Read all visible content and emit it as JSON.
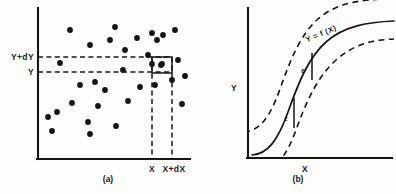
{
  "figure": {
    "panels": [
      {
        "id": "a",
        "caption": "(a)",
        "caption_x": 108,
        "caption_y": 182,
        "axes": {
          "y_axis": {
            "x": 38,
            "y_top": 8,
            "y_bottom": 159
          },
          "x_axis": {
            "y": 159,
            "x_left": 37,
            "x_right": 190
          }
        },
        "y_gridlines": [
          {
            "label": "Y+dY",
            "y": 57,
            "label_x": 34,
            "label_y": 60,
            "x_start": 38,
            "x_end": 172
          },
          {
            "label": "Y",
            "y": 72,
            "label_x": 34,
            "label_y": 75,
            "x_start": 38,
            "x_end": 172
          }
        ],
        "x_gridlines": [
          {
            "label": "X",
            "x": 152,
            "label_x": 152,
            "label_y": 172,
            "y_start": 57,
            "y_end": 159
          },
          {
            "label": "X+dX",
            "x": 172,
            "label_x": 174,
            "label_y": 172,
            "y_start": 57,
            "y_end": 159
          }
        ],
        "cell_box": {
          "x": 152,
          "y": 57,
          "width": 20,
          "height": 16
        },
        "points": [
          [
            70,
            30
          ],
          [
            115,
            27
          ],
          [
            90,
            45
          ],
          [
            110,
            40
          ],
          [
            125,
            50
          ],
          [
            137,
            38
          ],
          [
            152,
            33
          ],
          [
            157,
            40
          ],
          [
            163,
            35
          ],
          [
            175,
            30
          ],
          [
            60,
            63
          ],
          [
            123,
            70
          ],
          [
            148,
            55
          ],
          [
            161,
            65
          ],
          [
            178,
            60
          ],
          [
            162,
            64
          ],
          [
            152,
            64
          ],
          [
            80,
            85
          ],
          [
            95,
            82
          ],
          [
            140,
            87
          ],
          [
            155,
            85
          ],
          [
            172,
            80
          ],
          [
            105,
            90
          ],
          [
            185,
            76
          ],
          [
            72,
            103
          ],
          [
            98,
            106
          ],
          [
            128,
            101
          ],
          [
            182,
            104
          ],
          [
            48,
            117
          ],
          [
            57,
            112
          ],
          [
            88,
            122
          ],
          [
            116,
            126
          ],
          [
            52,
            131
          ],
          [
            90,
            134
          ]
        ],
        "point_radius": 2.9
      },
      {
        "id": "b",
        "caption": "(b)",
        "caption_x": 298,
        "caption_y": 182,
        "axes": {
          "y_axis": {
            "x": 248,
            "y_top": 8,
            "y_bottom": 158
          },
          "x_axis": {
            "y": 158,
            "x_left": 247,
            "x_right": 392
          }
        },
        "axis_labels": [
          {
            "name": "y-axis-label",
            "text": "Y",
            "x": 234,
            "y": 91
          },
          {
            "name": "x-axis-label",
            "text": "X",
            "x": 305,
            "y": 172
          }
        ],
        "curve_label": {
          "text": "Y = f (X)",
          "x": 322,
          "y": 36,
          "rotation": -23
        },
        "curves": {
          "center": "M 252,155 C 268,154 278,140 288,112 C 298,84 308,58 326,42 C 344,26 368,22 394,21",
          "upper": "M 244,132 C 260,131 270,117 280,89 C 290,61 300,35 318,19 C 336,3 360,-1 394,-1",
          "lower": "M 258,172 C 274,171 286,158 296,130 C 306,102 318,76 336,60 C 354,44 372,40 394,39"
        },
        "epsilon_markers": [
          {
            "label": "ε",
            "line_x": 312,
            "line_y_top": 53,
            "line_y_bottom": 80,
            "label_x": 303,
            "label_y": 73
          },
          {
            "label": "ε",
            "line_x": 294,
            "line_y_top": 98,
            "line_y_bottom": 128,
            "label_x": 286,
            "label_y": 121
          }
        ]
      }
    ]
  },
  "chart_data": {
    "type": "scatter",
    "title": "",
    "xlabel": "X",
    "ylabel": "Y",
    "panels": [
      {
        "name": "(a)",
        "type": "scatter",
        "description": "Bivariate scatter of observations with an elemental cell of width dX and height dY",
        "xlabel": "X",
        "ylabel": "Y",
        "x_tick_labels": [
          "X",
          "X+dX"
        ],
        "y_tick_labels": [
          "Y",
          "Y+dY"
        ],
        "n_points": 34,
        "grid": false,
        "legend": "none"
      },
      {
        "name": "(b)",
        "type": "line",
        "description": "Regression function Y = f (X) with dashed bands at plus and minus epsilon",
        "xlabel": "X",
        "ylabel": "Y",
        "series": [
          {
            "name": "Y = f (X)",
            "style": "solid"
          },
          {
            "name": "upper band",
            "style": "dashed"
          },
          {
            "name": "lower band",
            "style": "dashed"
          }
        ],
        "annotations": [
          "ε",
          "ε"
        ],
        "grid": false,
        "legend": "inline-label"
      }
    ]
  },
  "colors": {
    "ink": "#141414",
    "background": "#fdfdfb"
  }
}
